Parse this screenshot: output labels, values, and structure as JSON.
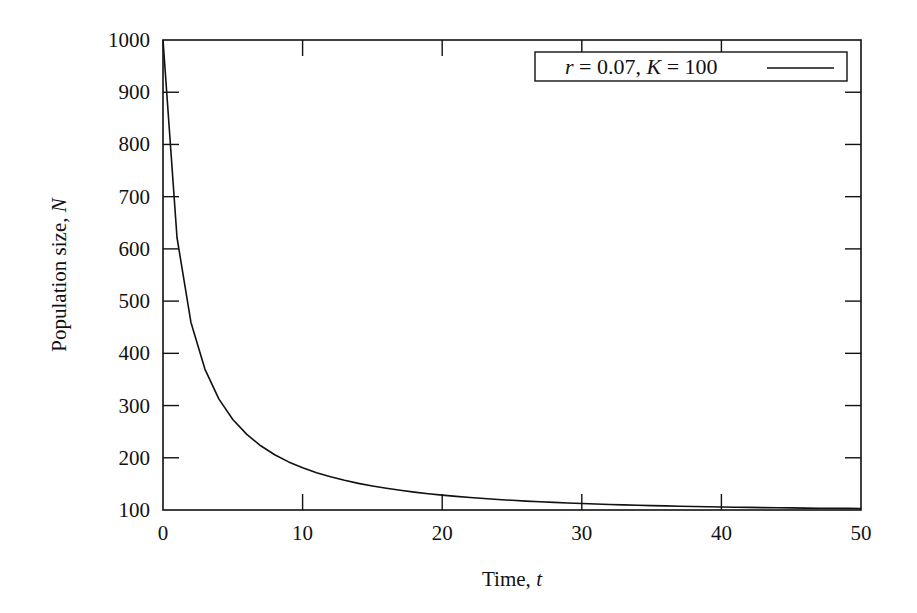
{
  "chart_data": {
    "type": "line",
    "title": "",
    "xlabel": "Time, t",
    "ylabel": "Population size, N",
    "xlim": [
      0,
      50
    ],
    "ylim": [
      100,
      1000
    ],
    "x_ticks": [
      0,
      10,
      20,
      30,
      40,
      50
    ],
    "y_ticks": [
      100,
      200,
      300,
      400,
      500,
      600,
      700,
      800,
      900,
      1000
    ],
    "grid": false,
    "legend_position": "upper right",
    "series": [
      {
        "name": "r = 0.07, K = 100",
        "model": "logistic",
        "params": {
          "r": 0.07,
          "K": 100,
          "N0": 1000
        },
        "color": "#111111",
        "x": [
          0,
          1,
          2,
          3,
          4,
          5,
          6,
          7,
          8,
          9,
          10,
          11,
          12,
          13,
          14,
          15,
          16,
          17,
          18,
          19,
          20,
          21,
          22,
          23,
          24,
          25,
          26,
          27,
          28,
          29,
          30,
          31,
          32,
          33,
          34,
          35,
          36,
          37,
          38,
          39,
          40,
          41,
          42,
          43,
          44,
          45,
          46,
          47,
          48,
          49,
          50
        ],
        "values": [
          1000,
          622,
          455,
          361,
          302,
          262,
          233,
          212,
          195,
          182,
          181,
          164,
          157,
          151,
          146,
          141,
          137,
          134,
          131,
          128,
          126,
          124,
          122,
          120,
          119,
          118,
          117,
          116,
          115,
          114,
          113,
          112,
          111,
          111,
          110,
          109,
          109,
          108,
          108,
          107,
          107,
          107,
          106,
          106,
          106,
          105,
          105,
          105,
          105,
          104,
          104
        ]
      }
    ]
  },
  "labels": {
    "xlabel_prefix": "Time, ",
    "xlabel_var": "t",
    "ylabel_prefix": "Population size, ",
    "ylabel_var": "N",
    "legend": "r = 0.07, K = 100"
  }
}
